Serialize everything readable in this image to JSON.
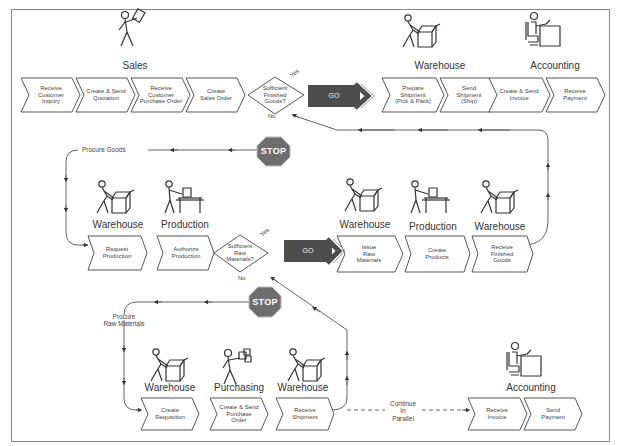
{
  "colors": {
    "line": "#555555",
    "go_fill": "#4d4d4d",
    "stop_fill": "#6e6e6e",
    "frame": "#888888"
  },
  "roles": {
    "sales": "Sales",
    "warehouse_top": "Warehouse",
    "accounting_top": "Accounting",
    "warehouse_mid_left": "Warehouse",
    "production_mid_left": "Production",
    "warehouse_mid_1": "Warehouse",
    "production_mid_right": "Production",
    "warehouse_mid_2": "Warehouse",
    "warehouse_bot_1": "Warehouse",
    "purchasing_bot": "Purchasing",
    "warehouse_bot_2": "Warehouse",
    "accounting_bot": "Accounting"
  },
  "steps": {
    "receive_customer_inquiry": "Receive\nCustomer\nInquiry",
    "create_send_quotation": "Create & Send\nQuotation",
    "receive_customer_po": "Receive\nCustomer\nPurchase Order",
    "create_sales_order": "Create\nSales Order",
    "prepare_shipment": "Prepare\nShipment\n(Pick & Pack)",
    "send_shipment": "Send\nShipment\n(Ship)",
    "create_send_invoice": "Create & Send\nInvoice",
    "receive_payment": "Receive\nPayment",
    "request_production": "Request\nProduction",
    "authorize_production": "Authorize\nProduction",
    "issue_raw_materials": "Issue\nRaw\nMaterials",
    "create_products": "Create\nProducts",
    "receive_finished_goods": "Receive\nFinished\nGoods",
    "create_requisition": "Create\nRequisition",
    "create_send_po": "Create & Send\nPurchase\nOrder",
    "receive_shipment": "Receive\nShipment",
    "receive_invoice": "Receive\nInvoice",
    "send_payment": "Send\nPayment"
  },
  "decisions": {
    "finished_goods": "Sufficient\nFinished\nGoods?",
    "raw_materials": "Sufficient\nRaw\nMaterials?"
  },
  "branch_labels": {
    "yes": "Yes",
    "no": "No"
  },
  "signals": {
    "go": "GO",
    "stop": "STOP"
  },
  "notes": {
    "procure_goods": "Procure Goods",
    "procure_raw_materials": "Procure\nRaw Materials",
    "continue_in_parallel": "Continue\nIn\nParallel"
  }
}
